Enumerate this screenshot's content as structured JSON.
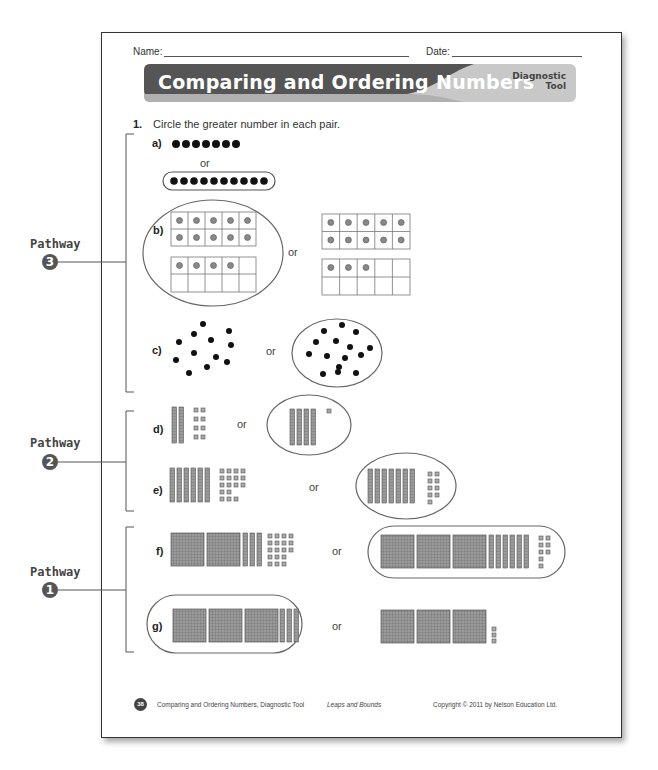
{
  "header": {
    "name_label": "Name:",
    "date_label": "Date:",
    "title": "Comparing and Ordering Numbers",
    "tag_line1": "Diagnostic",
    "tag_line2": "Tool",
    "banner_color": "#555555",
    "banner_accent": "#c8c8c8"
  },
  "question": {
    "number": "1.",
    "prompt": "Circle the greater number in each pair.",
    "or_label": "or",
    "items": [
      {
        "label": "a)",
        "left": "7 dots",
        "right": "10 dots",
        "circled": "right"
      },
      {
        "label": "b)",
        "left": "14 (ten frames)",
        "right": "13 (ten frames)",
        "circled": "left"
      },
      {
        "label": "c)",
        "left": "12 scattered dots",
        "right": "15 scattered dots",
        "circled": "right"
      },
      {
        "label": "d)",
        "left": "2 tens 8 ones",
        "right": "4 tens 1 one",
        "circled": "right"
      },
      {
        "label": "e)",
        "left": "6 tens 15 ones",
        "right": "7 tens 9 ones",
        "circled": "right"
      },
      {
        "label": "f)",
        "left": "2 hundreds 3 tens 15 ones",
        "right": "3 hundreds 6 tens 8 ones",
        "circled": "right"
      },
      {
        "label": "g)",
        "left": "3 hundreds 3 tens",
        "right": "3 hundreds 3 ones",
        "circled": "left"
      }
    ]
  },
  "pathways": [
    {
      "label": "Pathway",
      "number": "3"
    },
    {
      "label": "Pathway",
      "number": "2"
    },
    {
      "label": "Pathway",
      "number": "1"
    }
  ],
  "footer": {
    "page_number": "38",
    "title": "Comparing and Ordering Numbers, Diagnostic Tool",
    "series": "Leaps and Bounds",
    "copyright": "Copyright © 2011 by Nelson Education Ltd."
  }
}
